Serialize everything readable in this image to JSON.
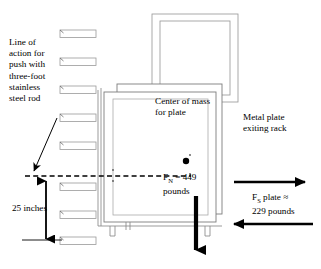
{
  "diagram": {
    "canvas": {
      "width": 321,
      "height": 269,
      "background": "#ffffff"
    },
    "ink_color": "#000000",
    "light_line_color": "#8a8a8a"
  },
  "labels": {
    "line_of_action": "Line of\naction for\npush with\nthree-foot\nstainless\nsteel rod",
    "center_of_mass": "Center of mass\nfor plate",
    "normal_force_prefix": "F",
    "normal_force_subscript": "N",
    "normal_force_value": " = 449\npounds",
    "metal_plate": "Metal plate\nexiting rack",
    "shear_force_prefix": "F",
    "shear_force_subscript": "S",
    "shear_force_value": " plate ≈\n229 pounds",
    "dimension_25": "25 inches"
  },
  "values": {
    "normal_force_pounds": 449,
    "shear_force_pounds": 229,
    "height_inches": 25,
    "rod_length_feet": 3,
    "shelf_count": 8
  },
  "icons": {
    "center_of_mass_dot": "filled-circle",
    "weight_arrow": "down-arrow",
    "push_arrow": "right-arrow",
    "reaction_arrow": "left-arrow",
    "leader_arrow": "diagonal-arrow",
    "dimension_arrows": "up-down-arrow",
    "line_of_action": "dashed-horizontal-line"
  },
  "geometry": {
    "shelves_y": [
      30,
      58,
      86,
      114,
      142,
      172,
      200,
      228
    ],
    "shelf_x": 60,
    "shelf_width": 36,
    "shelf_height": 8,
    "dashed_line_y": 176,
    "dashed_line_x1": 25,
    "dashed_line_x2": 191,
    "rack_post_x": 98,
    "plate_front": {
      "x": 104,
      "y": 92,
      "w": 114,
      "h": 130
    },
    "plate_mid": {
      "x": 118,
      "y": 84,
      "w": 114,
      "h": 130
    },
    "plate_back": {
      "x": 152,
      "y": 14,
      "w": 84,
      "h": 86
    },
    "plate_back2": {
      "x": 160,
      "y": 8,
      "w": 84,
      "h": 86
    },
    "com_dot": {
      "cx": 186,
      "cy": 161,
      "r": 3.1
    },
    "weight_arrow": {
      "x": 196,
      "y1": 196,
      "y2": 262
    },
    "push_arrow": {
      "y": 182,
      "x1": 234,
      "x2": 313
    },
    "react_arrow": {
      "y": 224,
      "x1": 313,
      "x2": 226
    },
    "dim_arrow": {
      "x": 46,
      "y1": 177,
      "y2": 240
    }
  }
}
